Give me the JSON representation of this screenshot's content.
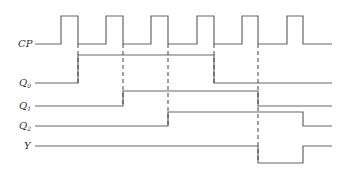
{
  "diagram": {
    "type": "timing-diagram",
    "signals": [
      {
        "name": "CP",
        "label": "CP",
        "sub": "",
        "low_y": 44,
        "high_y": 16,
        "points": "35,44 61,44 61,16 78,16 78,44 106,44 106,16 123,16 123,44 151,44 151,16 168,16 168,44 197,44 197,16 214,16 214,44 242,44 242,16 258,16 258,44 287,44 287,16 303,16 303,44 332,44"
      },
      {
        "name": "Q0",
        "label": "Q",
        "sub": "0",
        "points": "35,83 78,83 78,55 214,55 214,83 332,83"
      },
      {
        "name": "Q1",
        "label": "Q",
        "sub": "1",
        "points": "35,106 123,106 123,91 258,91 258,106 332,106"
      },
      {
        "name": "Q2",
        "label": "Q",
        "sub": "2",
        "points": "35,126 168,126 168,112 303,112 303,126 332,126"
      },
      {
        "name": "Y",
        "label": "Y",
        "sub": "",
        "points": "35,146 258,146 258,163 303,163 303,146 332,146"
      }
    ],
    "dashed_lines": [
      {
        "x": 78,
        "y1": 44,
        "y2": 83
      },
      {
        "x": 123,
        "y1": 44,
        "y2": 106
      },
      {
        "x": 168,
        "y1": 44,
        "y2": 126
      },
      {
        "x": 214,
        "y1": 44,
        "y2": 83
      },
      {
        "x": 258,
        "y1": 44,
        "y2": 163
      }
    ],
    "labels": {
      "cp": "CP",
      "q0": "Q",
      "q0_sub": "0",
      "q1": "Q",
      "q1_sub": "1",
      "q2": "Q",
      "q2_sub": "2",
      "y": "Y"
    }
  }
}
